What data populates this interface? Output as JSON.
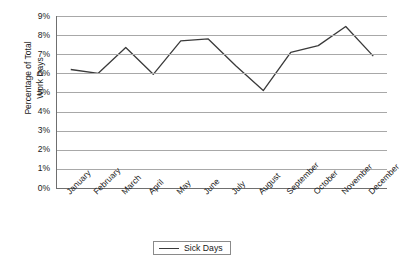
{
  "chart_data": {
    "type": "line",
    "title": "",
    "xlabel": "",
    "ylabel": "Percentage of Total\nWork Days",
    "categories": [
      "January",
      "February",
      "March",
      "April",
      "May",
      "June",
      "July",
      "August",
      "September",
      "October",
      "November",
      "December"
    ],
    "series": [
      {
        "name": "Sick Days",
        "values": [
          6.2,
          6.0,
          7.35,
          5.95,
          7.7,
          7.8,
          6.4,
          5.1,
          7.1,
          7.45,
          8.45,
          6.9
        ]
      }
    ],
    "ylim": [
      0,
      9
    ],
    "ytick_labels": [
      "9%",
      "8%",
      "7%",
      "6%",
      "5%",
      "4%",
      "3%",
      "2%",
      "1%",
      "0%"
    ],
    "ytick_values": [
      9,
      8,
      7,
      6,
      5,
      4,
      3,
      2,
      1,
      0
    ],
    "grid": true,
    "legend_position": "bottom-center",
    "legend_entries": [
      "Sick Days"
    ],
    "colors": {
      "line": "#3a3a3a",
      "gridline": "#a8a8a8",
      "axis": "#6f6f6f",
      "text": "#1a1a1a",
      "background": "#ffffff"
    }
  }
}
